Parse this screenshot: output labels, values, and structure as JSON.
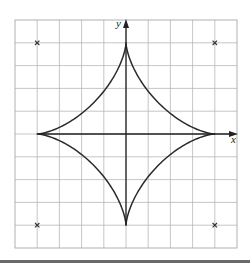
{
  "figure": {
    "type": "astroid",
    "equation": "x^(2/3) + y^(2/3) = 4^(2/3)",
    "axis_labels": {
      "x": "x",
      "y": "y"
    },
    "grid": {
      "x_range": [
        -5,
        5
      ],
      "y_range": [
        -5,
        5
      ],
      "step": 1
    },
    "cusps": [
      [
        4,
        0
      ],
      [
        0,
        4
      ],
      [
        -4,
        0
      ],
      [
        0,
        -4
      ]
    ],
    "markers": [
      {
        "x": -4,
        "y": 4,
        "symbol": "×"
      },
      {
        "x": 4,
        "y": 4,
        "symbol": "×"
      },
      {
        "x": -4,
        "y": -4,
        "symbol": "×"
      },
      {
        "x": 4,
        "y": -4,
        "symbol": "×"
      }
    ],
    "colors": {
      "curve": "#2a2a2a",
      "axis": "#222222",
      "grid": "#b8b8b8",
      "background": "#ffffff"
    }
  }
}
